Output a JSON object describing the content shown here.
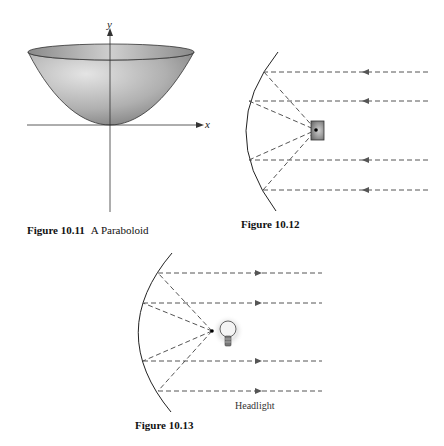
{
  "figures": [
    {
      "id": "fig-10-11",
      "number": "Figure 10.11",
      "title": "A Paraboloid",
      "axes": {
        "x_label": "x",
        "y_label": "y"
      }
    },
    {
      "id": "fig-10-12",
      "number": "Figure 10.12",
      "title": "",
      "description": "Parallel incoming rays reflect off a parabolic mirror into the focus (receiver)",
      "ray_direction": "left"
    },
    {
      "id": "fig-10-13",
      "number": "Figure 10.13",
      "title": "",
      "annotation": "Headlight",
      "description": "Light from a bulb at the focus reflects off a parabolic mirror into parallel outgoing rays",
      "ray_direction": "right"
    }
  ],
  "colors": {
    "line": "#333333",
    "dash": "#555555",
    "surface_light": "#d8d8d8",
    "surface_dark": "#8a8a8a"
  }
}
